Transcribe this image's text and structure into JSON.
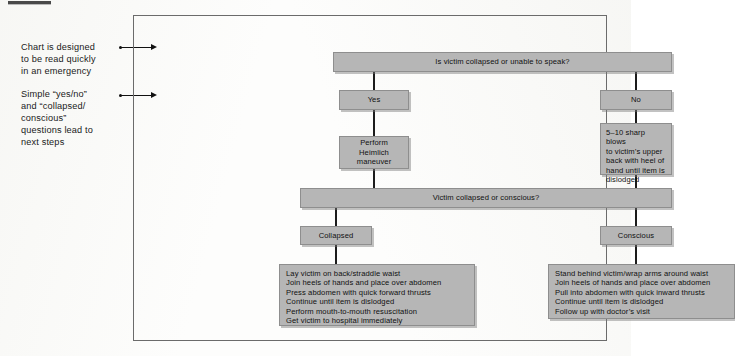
{
  "figure": {
    "kind": "flowchart"
  },
  "annotations": [
    {
      "id": "annot-1",
      "text": "Chart is designed\nto be read quickly\nin an emergency"
    },
    {
      "id": "annot-2",
      "text": "Simple “yes/no”\nand “collapsed/\nconscious”\nquestions lead to\nnext steps"
    }
  ],
  "chart_data": {
    "type": "diagram",
    "title": "",
    "nodes": [
      {
        "id": "q1",
        "label": "Is victim collapsed or unable to speak?",
        "shape": "bar",
        "role": "question"
      },
      {
        "id": "yes",
        "label": "Yes",
        "shape": "box",
        "role": "branch"
      },
      {
        "id": "no",
        "label": "No",
        "shape": "box",
        "role": "branch"
      },
      {
        "id": "heimlich",
        "label": "Perform\nHeimlich\nmaneuver",
        "shape": "box",
        "role": "action"
      },
      {
        "id": "blows",
        "label": "5–10 sharp blows\nto victim’s upper\nback with heel of\nhand until item is\ndislodged",
        "shape": "box",
        "role": "action"
      },
      {
        "id": "q2",
        "label": "Victim collapsed or conscious?",
        "shape": "bar",
        "role": "question"
      },
      {
        "id": "collapsed",
        "label": "Collapsed",
        "shape": "box",
        "role": "branch"
      },
      {
        "id": "conscious",
        "label": "Conscious",
        "shape": "box",
        "role": "branch"
      },
      {
        "id": "list-left",
        "label": "Lay victim on back/straddle waist\nJoin heels of hands and place over abdomen\nPress abdomen with quick forward thrusts\nContinue until item is dislodged\nPerform mouth-to-mouth resuscitation\nGet victim to hospital immediately",
        "shape": "box",
        "role": "steps"
      },
      {
        "id": "list-right",
        "label": "Stand behind victim/wrap arms around waist\nJoin heels of hands and place over abdomen\nPull into abdomen with quick inward thrusts\nContinue until item is dislodged\nFollow up with doctor’s visit",
        "shape": "box",
        "role": "steps"
      }
    ],
    "edges": [
      {
        "from": "q1",
        "to": "yes"
      },
      {
        "from": "q1",
        "to": "no"
      },
      {
        "from": "yes",
        "to": "heimlich"
      },
      {
        "from": "no",
        "to": "blows"
      },
      {
        "from": "heimlich",
        "to": "q2"
      },
      {
        "from": "blows",
        "to": "q2"
      },
      {
        "from": "q2",
        "to": "collapsed"
      },
      {
        "from": "q2",
        "to": "conscious"
      },
      {
        "from": "collapsed",
        "to": "list-left"
      },
      {
        "from": "conscious",
        "to": "list-right"
      }
    ],
    "colors": {
      "node_fill": "#b6b6b6",
      "node_border": "#8e8e8e",
      "connector": "#1c1c1c",
      "frame_border": "#6b6b6b",
      "page_background": "#fdfdfc",
      "text": "#101010"
    }
  }
}
